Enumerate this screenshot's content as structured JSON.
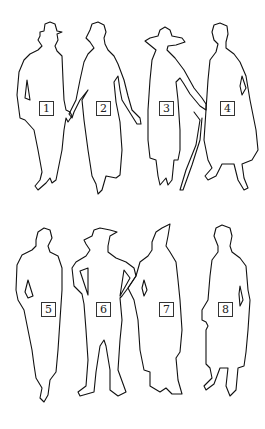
{
  "figure": {
    "stroke_color": "#111111",
    "background": "#ffffff",
    "rows": [
      {
        "figures": [
          {
            "label": "1",
            "box": {
              "x": 39,
              "y": 101
            }
          },
          {
            "label": "2",
            "box": {
              "x": 96,
              "y": 101
            }
          },
          {
            "label": "3",
            "box": {
              "x": 159,
              "y": 101
            }
          },
          {
            "label": "4",
            "box": {
              "x": 220,
              "y": 101
            }
          }
        ]
      },
      {
        "figures": [
          {
            "label": "5",
            "box": {
              "x": 41,
              "y": 302
            }
          },
          {
            "label": "6",
            "box": {
              "x": 96,
              "y": 302
            }
          },
          {
            "label": "7",
            "box": {
              "x": 159,
              "y": 302
            }
          },
          {
            "label": "8",
            "box": {
              "x": 218,
              "y": 302
            }
          }
        ]
      }
    ]
  }
}
